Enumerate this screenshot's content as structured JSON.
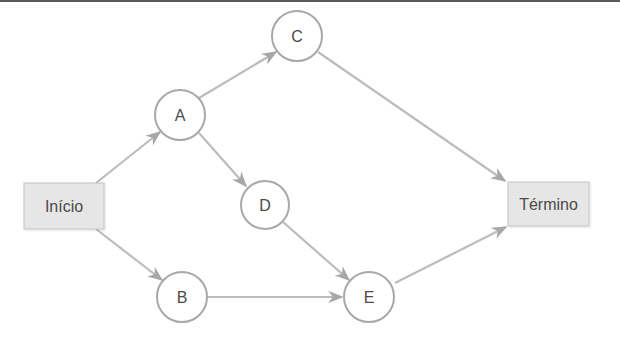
{
  "diagram": {
    "type": "network-flow",
    "colors": {
      "edge": "#b8b8b8",
      "node_stroke": "#a8a8a8",
      "box_fill": "#e6e6e6",
      "text": "#4a4a4a",
      "top_rule": "#5a5a5a"
    },
    "nodes": {
      "inicio": {
        "label": "Início",
        "shape": "box"
      },
      "termino": {
        "label": "Término",
        "shape": "box"
      },
      "a": {
        "label": "A",
        "shape": "circle"
      },
      "b": {
        "label": "B",
        "shape": "circle"
      },
      "c": {
        "label": "C",
        "shape": "circle"
      },
      "d": {
        "label": "D",
        "shape": "circle"
      },
      "e": {
        "label": "E",
        "shape": "circle"
      }
    },
    "edges": [
      {
        "from": "Início",
        "to": "A"
      },
      {
        "from": "Início",
        "to": "B"
      },
      {
        "from": "A",
        "to": "C"
      },
      {
        "from": "A",
        "to": "D"
      },
      {
        "from": "C",
        "to": "Término"
      },
      {
        "from": "D",
        "to": "E"
      },
      {
        "from": "B",
        "to": "E"
      },
      {
        "from": "E",
        "to": "Término"
      }
    ]
  }
}
